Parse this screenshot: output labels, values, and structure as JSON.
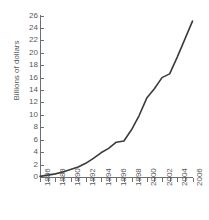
{
  "chart_data": {
    "type": "line",
    "title": "",
    "xlabel": "",
    "ylabel": "Billions of dollars",
    "ylim": [
      0,
      26
    ],
    "xlim": [
      1986,
      2006
    ],
    "ytick_step": 2,
    "xtick_step": 1,
    "xlabel_step": 2,
    "grid": false,
    "legend": "none",
    "line_color": "#3b3b3d",
    "axis_color": "#6d6e70",
    "text_color": "#58585a",
    "yticks": [
      0,
      2,
      4,
      6,
      8,
      10,
      12,
      14,
      16,
      18,
      20,
      22,
      24,
      26
    ],
    "xticks": [
      1986,
      1987,
      1988,
      1989,
      1990,
      1991,
      1992,
      1993,
      1994,
      1995,
      1996,
      1997,
      1998,
      1999,
      2000,
      2001,
      2002,
      2003,
      2004,
      2005,
      2006
    ],
    "xtick_labels": [
      "1986",
      "1988",
      "1990",
      "1992",
      "1994",
      "1996",
      "1998",
      "2000",
      "2002",
      "2004",
      "2006"
    ],
    "x": [
      1986,
      1987,
      1988,
      1989,
      1990,
      1991,
      1992,
      1993,
      1994,
      1995,
      1996,
      1997,
      1998,
      1999,
      2000,
      2001,
      2002,
      2003,
      2004,
      2005,
      2006
    ],
    "values": [
      0.1,
      0.3,
      0.5,
      0.8,
      1.2,
      1.6,
      2.2,
      3.0,
      3.9,
      4.6,
      5.6,
      5.8,
      7.6,
      9.9,
      12.7,
      14.2,
      16.0,
      16.6,
      19.3,
      22.2,
      25.1
    ]
  }
}
